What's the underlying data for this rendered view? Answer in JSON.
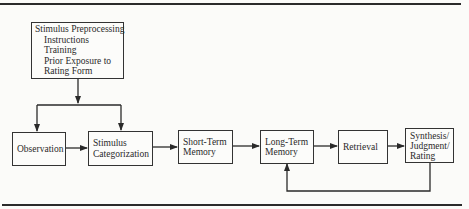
{
  "diagram": {
    "preprocessing": {
      "title": "Stimulus Preprocessing",
      "items": [
        "Instructions",
        "Training",
        "Prior Exposure to",
        "Rating Form"
      ]
    },
    "nodes": {
      "observation": [
        "Observation"
      ],
      "categorization": [
        "Stimulus",
        "Categorization"
      ],
      "short_term": [
        "Short-Term",
        "Memory"
      ],
      "long_term": [
        "Long-Term",
        "Memory"
      ],
      "retrieval": [
        "Retrieval"
      ],
      "synthesis": [
        "Synthesis/",
        "Judgment/",
        "Rating"
      ]
    },
    "edges": [
      {
        "from": "preprocessing",
        "to": "observation"
      },
      {
        "from": "preprocessing",
        "to": "categorization"
      },
      {
        "from": "observation",
        "to": "categorization"
      },
      {
        "from": "categorization",
        "to": "short_term"
      },
      {
        "from": "short_term",
        "to": "long_term"
      },
      {
        "from": "long_term",
        "to": "retrieval"
      },
      {
        "from": "retrieval",
        "to": "synthesis"
      },
      {
        "from": "synthesis",
        "to": "long_term",
        "type": "feedback"
      }
    ]
  }
}
